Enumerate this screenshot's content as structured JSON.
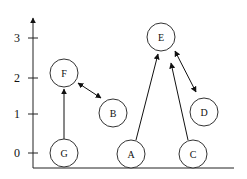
{
  "diagram": {
    "y_axis": {
      "ticks": [
        {
          "label": "3",
          "y": 38
        },
        {
          "label": "2",
          "y": 78
        },
        {
          "label": "1",
          "y": 114
        },
        {
          "label": "0",
          "y": 153
        }
      ]
    },
    "nodes": [
      {
        "id": "F",
        "label": "F",
        "cx": 64,
        "cy": 73
      },
      {
        "id": "B",
        "label": "B",
        "cx": 113,
        "cy": 113
      },
      {
        "id": "G",
        "label": "G",
        "cx": 64,
        "cy": 153
      },
      {
        "id": "A",
        "label": "A",
        "cx": 131,
        "cy": 154
      },
      {
        "id": "E",
        "label": "E",
        "cx": 161,
        "cy": 37
      },
      {
        "id": "D",
        "label": "D",
        "cx": 204,
        "cy": 112
      },
      {
        "id": "C",
        "label": "C",
        "cx": 193,
        "cy": 154
      }
    ],
    "edges": [
      {
        "from": "G",
        "to": "F",
        "bidirectional": false
      },
      {
        "from": "F",
        "to": "B",
        "bidirectional": true
      },
      {
        "from": "A",
        "to": "E",
        "bidirectional": false
      },
      {
        "from": "C",
        "to": "E",
        "bidirectional": false
      },
      {
        "from": "E",
        "to": "D",
        "bidirectional": true
      }
    ]
  }
}
